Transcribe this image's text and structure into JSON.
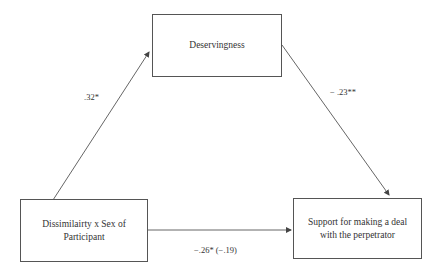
{
  "diagram": {
    "type": "mediation-model",
    "nodes": {
      "mediator": {
        "label": "Deservingness"
      },
      "predictor": {
        "label": "Dissimilairty x Sex of Participant"
      },
      "outcome": {
        "label": "Support for making a deal with the perpetrator"
      }
    },
    "paths": {
      "a": {
        "from": "predictor",
        "to": "mediator",
        "label": ".32*"
      },
      "b": {
        "from": "mediator",
        "to": "outcome",
        "label": "− .23**"
      },
      "c": {
        "from": "predictor",
        "to": "outcome",
        "label": "−.26* (−.19)"
      }
    },
    "colors": {
      "line": "#555555",
      "text": "#333333",
      "background": "#ffffff"
    }
  }
}
